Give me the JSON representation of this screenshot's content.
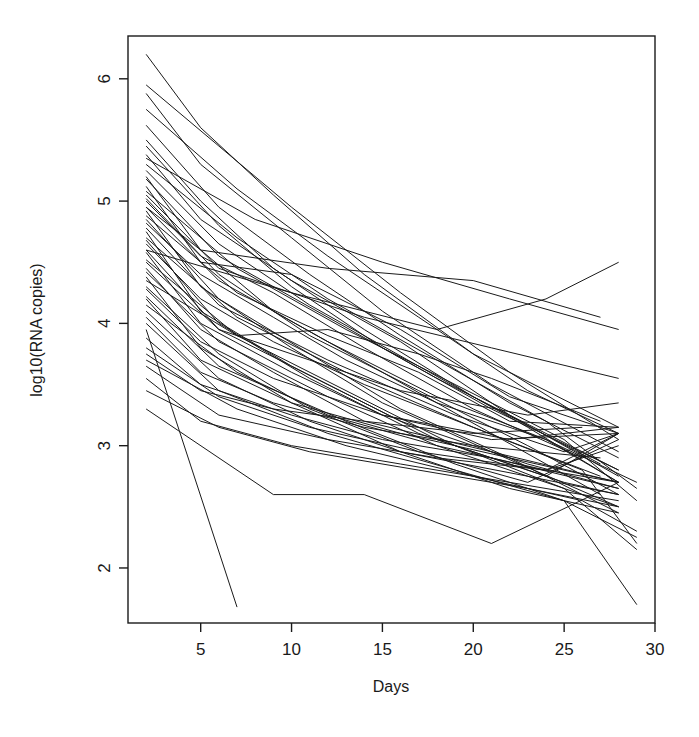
{
  "chart_data": {
    "type": "line",
    "title": "",
    "subtitle": "",
    "xlabel": "Days",
    "ylabel": "log10(RNA copies)",
    "xlim": [
      1.0,
      30.0
    ],
    "ylim": [
      1.55,
      6.35
    ],
    "xticks": [
      5,
      10,
      15,
      20,
      25,
      30
    ],
    "xtick_labels": [
      "5",
      "10",
      "15",
      "20",
      "25",
      "30"
    ],
    "yticks": [
      2,
      3,
      4,
      5,
      6
    ],
    "ytick_labels": [
      "2",
      "3",
      "4",
      "5",
      "6"
    ],
    "grid": false,
    "legend": null,
    "legend_position": "none",
    "line_color": "#1a1a1a",
    "line_width": 1.0,
    "n_series": 55,
    "series_label_prefix": "subject",
    "x": [
      2,
      5,
      8,
      11,
      14,
      17,
      20,
      23,
      26,
      28
    ],
    "series": [
      {
        "name": "subject-01",
        "x": [
          2,
          5,
          9,
          14,
          20,
          28
        ],
        "values": [
          6.2,
          5.6,
          5.05,
          4.4,
          3.75,
          3.15
        ]
      },
      {
        "name": "subject-02",
        "x": [
          2,
          6,
          10,
          16,
          22,
          28
        ],
        "values": [
          5.95,
          5.45,
          4.95,
          4.25,
          3.6,
          3.05
        ]
      },
      {
        "name": "subject-03",
        "x": [
          2,
          5,
          10,
          15,
          21,
          28
        ],
        "values": [
          5.88,
          5.3,
          4.7,
          4.1,
          3.5,
          2.95
        ]
      },
      {
        "name": "subject-04",
        "x": [
          2,
          7,
          12,
          17,
          23,
          28
        ],
        "values": [
          5.75,
          5.1,
          4.55,
          4.05,
          3.45,
          3.1
        ]
      },
      {
        "name": "subject-05",
        "x": [
          2,
          6,
          11,
          16,
          22,
          28
        ],
        "values": [
          5.62,
          4.95,
          4.4,
          3.9,
          3.35,
          2.9
        ]
      },
      {
        "name": "subject-06",
        "x": [
          2,
          5,
          9,
          14,
          20,
          27
        ],
        "values": [
          5.5,
          5.0,
          4.45,
          3.95,
          3.4,
          2.85
        ]
      },
      {
        "name": "subject-07",
        "x": [
          2,
          6,
          10,
          15,
          21,
          28
        ],
        "values": [
          5.45,
          4.8,
          4.3,
          3.8,
          3.3,
          2.8
        ]
      },
      {
        "name": "subject-08",
        "x": [
          2,
          5,
          10,
          16,
          22,
          28
        ],
        "values": [
          5.38,
          4.85,
          4.35,
          3.85,
          3.25,
          2.75
        ]
      },
      {
        "name": "subject-09",
        "x": [
          2,
          7,
          12,
          18,
          24,
          29
        ],
        "values": [
          5.3,
          4.7,
          4.2,
          3.7,
          3.2,
          2.65
        ]
      },
      {
        "name": "subject-10",
        "x": [
          2,
          6,
          11,
          17,
          23,
          28
        ],
        "values": [
          5.25,
          4.65,
          4.15,
          3.65,
          3.15,
          2.7
        ]
      },
      {
        "name": "subject-11",
        "x": [
          2,
          5,
          9,
          15,
          21,
          27
        ],
        "values": [
          5.2,
          4.6,
          4.1,
          3.6,
          3.1,
          2.6
        ]
      },
      {
        "name": "subject-12",
        "x": [
          2,
          6,
          12,
          18,
          24,
          28
        ],
        "values": [
          5.18,
          4.55,
          4.05,
          3.55,
          3.1,
          2.8
        ]
      },
      {
        "name": "subject-13",
        "x": [
          2,
          5,
          10,
          16,
          22,
          28
        ],
        "values": [
          5.12,
          4.5,
          4.4,
          3.95,
          3.4,
          3.1
        ]
      },
      {
        "name": "subject-14",
        "x": [
          2,
          7,
          13,
          19,
          25,
          29
        ],
        "values": [
          5.08,
          4.45,
          3.95,
          3.5,
          3.05,
          2.55
        ]
      },
      {
        "name": "subject-15",
        "x": [
          2,
          6,
          11,
          17,
          23,
          28
        ],
        "values": [
          5.02,
          4.4,
          3.9,
          3.45,
          3.0,
          2.6
        ]
      },
      {
        "name": "subject-16",
        "x": [
          2,
          5,
          9,
          14,
          20,
          26
        ],
        "values": [
          5.0,
          4.55,
          4.25,
          3.8,
          3.3,
          2.9
        ]
      },
      {
        "name": "subject-17",
        "x": [
          2,
          6,
          12,
          18,
          24,
          28
        ],
        "values": [
          4.95,
          4.35,
          3.85,
          3.4,
          3.05,
          2.7
        ]
      },
      {
        "name": "subject-18",
        "x": [
          2,
          5,
          10,
          15,
          21,
          28
        ],
        "values": [
          4.92,
          4.3,
          3.8,
          3.35,
          2.95,
          2.5
        ]
      },
      {
        "name": "subject-19",
        "x": [
          2,
          7,
          12,
          17,
          22,
          28
        ],
        "values": [
          4.88,
          4.25,
          3.9,
          3.6,
          3.2,
          3.15
        ]
      },
      {
        "name": "subject-20",
        "x": [
          2,
          6,
          11,
          16,
          22,
          28
        ],
        "values": [
          4.85,
          4.2,
          3.75,
          3.3,
          2.9,
          2.45
        ]
      },
      {
        "name": "subject-21",
        "x": [
          2,
          5,
          9,
          13,
          18,
          24,
          29
        ],
        "values": [
          4.82,
          4.4,
          4.05,
          3.7,
          3.35,
          3.05,
          2.7
        ]
      },
      {
        "name": "subject-22",
        "x": [
          2,
          6,
          12,
          19,
          25,
          28
        ],
        "values": [
          4.78,
          4.15,
          3.7,
          3.25,
          2.95,
          3.1
        ]
      },
      {
        "name": "subject-23",
        "x": [
          2,
          5,
          10,
          16,
          23,
          28
        ],
        "values": [
          4.75,
          4.1,
          3.65,
          3.2,
          2.85,
          2.65
        ]
      },
      {
        "name": "subject-24",
        "x": [
          2,
          7,
          13,
          20,
          26,
          29
        ],
        "values": [
          4.7,
          4.05,
          3.6,
          3.15,
          2.8,
          2.2
        ]
      },
      {
        "name": "subject-25",
        "x": [
          2,
          6,
          11,
          17,
          24,
          28
        ],
        "values": [
          4.68,
          4.0,
          3.55,
          3.1,
          2.75,
          3.1
        ]
      },
      {
        "name": "subject-26",
        "x": [
          2,
          5,
          9,
          14,
          20,
          27
        ],
        "values": [
          4.65,
          4.2,
          3.85,
          3.5,
          3.15,
          2.75
        ]
      },
      {
        "name": "subject-27",
        "x": [
          2,
          6,
          12,
          18,
          25,
          28
        ],
        "values": [
          4.6,
          3.95,
          3.5,
          3.05,
          2.7,
          2.6
        ]
      },
      {
        "name": "subject-28",
        "x": [
          2,
          5,
          10,
          15,
          22,
          28
        ],
        "values": [
          4.58,
          4.0,
          3.6,
          3.25,
          3.05,
          3.15
        ]
      },
      {
        "name": "subject-29",
        "x": [
          2,
          7,
          13,
          19,
          25,
          29
        ],
        "values": [
          4.52,
          3.9,
          3.45,
          3.0,
          2.65,
          2.15
        ]
      },
      {
        "name": "subject-30",
        "x": [
          2,
          6,
          11,
          16,
          23,
          28
        ],
        "values": [
          4.5,
          3.95,
          3.7,
          3.45,
          3.25,
          3.35
        ]
      },
      {
        "name": "subject-31",
        "x": [
          2,
          5,
          9,
          14,
          21,
          28
        ],
        "values": [
          4.45,
          3.95,
          3.6,
          3.2,
          2.95,
          2.7
        ]
      },
      {
        "name": "subject-32",
        "x": [
          2,
          6,
          12,
          18,
          24,
          28
        ],
        "values": [
          4.42,
          3.85,
          3.4,
          3.0,
          2.7,
          2.5
        ]
      },
      {
        "name": "subject-33",
        "x": [
          2,
          5,
          10,
          16,
          22,
          28
        ],
        "values": [
          4.38,
          3.8,
          3.35,
          2.95,
          2.65,
          2.45
        ]
      },
      {
        "name": "subject-34",
        "x": [
          2,
          7,
          12,
          17,
          21,
          27
        ],
        "values": [
          4.35,
          3.9,
          3.95,
          3.75,
          3.55,
          3.2
        ]
      },
      {
        "name": "subject-35",
        "x": [
          2,
          6,
          11,
          17,
          23,
          28
        ],
        "values": [
          4.3,
          3.75,
          3.3,
          2.95,
          2.7,
          3.05
        ]
      },
      {
        "name": "subject-36",
        "x": [
          2,
          5,
          9,
          15,
          21,
          28
        ],
        "values": [
          4.28,
          3.85,
          3.55,
          3.25,
          3.05,
          3.1
        ]
      },
      {
        "name": "subject-37",
        "x": [
          2,
          6,
          13,
          19,
          25,
          29
        ],
        "values": [
          4.22,
          3.65,
          3.2,
          2.85,
          2.55,
          2.25
        ]
      },
      {
        "name": "subject-38",
        "x": [
          2,
          5,
          10,
          16,
          22,
          28
        ],
        "values": [
          4.2,
          3.7,
          3.35,
          3.1,
          2.9,
          2.7
        ]
      },
      {
        "name": "subject-39",
        "x": [
          2,
          7,
          12,
          18,
          24,
          28
        ],
        "values": [
          4.15,
          3.6,
          3.25,
          3.0,
          2.8,
          3.0
        ]
      },
      {
        "name": "subject-40",
        "x": [
          2,
          6,
          11,
          16,
          23,
          28
        ],
        "values": [
          4.1,
          3.55,
          3.2,
          2.95,
          2.75,
          2.6
        ]
      },
      {
        "name": "subject-41",
        "x": [
          2,
          5,
          9,
          14,
          20,
          27
        ],
        "values": [
          4.05,
          3.6,
          3.35,
          3.15,
          3.0,
          2.9
        ]
      },
      {
        "name": "subject-42",
        "x": [
          2,
          6,
          12,
          19,
          25,
          29
        ],
        "values": [
          4.0,
          3.45,
          3.1,
          2.8,
          2.55,
          1.7
        ]
      },
      {
        "name": "subject-43",
        "x": [
          2,
          7
        ],
        "values": [
          3.95,
          1.68
        ]
      },
      {
        "name": "subject-44",
        "x": [
          2,
          5,
          10,
          15,
          21,
          28
        ],
        "values": [
          3.88,
          3.5,
          3.25,
          3.05,
          2.9,
          2.65
        ]
      },
      {
        "name": "subject-45",
        "x": [
          2,
          6,
          11,
          17,
          24,
          28
        ],
        "values": [
          3.8,
          3.4,
          3.15,
          2.95,
          2.8,
          3.1
        ]
      },
      {
        "name": "subject-46",
        "x": [
          2,
          5,
          9,
          14,
          20,
          26
        ],
        "values": [
          3.75,
          3.45,
          3.3,
          3.2,
          3.1,
          3.15
        ]
      },
      {
        "name": "subject-47",
        "x": [
          2,
          7,
          13,
          20,
          26,
          29
        ],
        "values": [
          3.7,
          3.3,
          3.0,
          2.75,
          2.55,
          2.3
        ]
      },
      {
        "name": "subject-48",
        "x": [
          2,
          6,
          12,
          18,
          24,
          28
        ],
        "values": [
          3.65,
          3.25,
          3.05,
          2.9,
          2.8,
          2.7
        ]
      },
      {
        "name": "subject-49",
        "x": [
          2,
          5,
          10,
          16,
          22,
          28
        ],
        "values": [
          3.55,
          3.2,
          3.0,
          2.85,
          2.7,
          2.55
        ]
      },
      {
        "name": "subject-50",
        "x": [
          2,
          6,
          11,
          17,
          23,
          28
        ],
        "values": [
          3.45,
          3.15,
          2.95,
          2.8,
          2.65,
          2.5
        ]
      },
      {
        "name": "subject-51",
        "x": [
          2,
          9,
          14,
          21,
          28
        ],
        "values": [
          3.3,
          2.6,
          2.6,
          2.2,
          2.7
        ]
      },
      {
        "name": "subject-52",
        "x": [
          2,
          5,
          12,
          20,
          27
        ],
        "values": [
          4.95,
          4.6,
          4.45,
          4.35,
          4.05
        ]
      },
      {
        "name": "subject-53",
        "x": [
          2,
          8,
          15,
          22,
          28
        ],
        "values": [
          5.35,
          4.85,
          4.5,
          4.2,
          3.95
        ]
      },
      {
        "name": "subject-54",
        "x": [
          2,
          10,
          18,
          24,
          28
        ],
        "values": [
          4.6,
          4.25,
          3.95,
          4.2,
          4.5
        ]
      },
      {
        "name": "subject-55",
        "x": [
          2,
          6,
          14,
          21,
          28
        ],
        "values": [
          5.05,
          4.45,
          4.05,
          3.8,
          3.55
        ]
      }
    ]
  },
  "plot_geometry": {
    "box_left": 128,
    "box_right": 655,
    "box_top": 36,
    "box_bottom": 623,
    "canvas_width": 699,
    "canvas_height": 737
  },
  "axes": {
    "x_axis_title": "Days",
    "y_axis_title": "log10(RNA copies)"
  }
}
